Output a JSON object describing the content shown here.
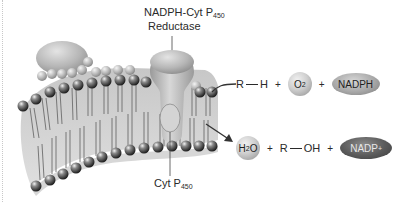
{
  "figure": {
    "type": "membrane-enzyme-diagram",
    "palette": {
      "background": "#ffffff",
      "text": "#2a2a2a",
      "protein": "#b4b4b4",
      "lipid_head": "#3a3a3a",
      "lipid_tail": "#6e6e6e",
      "membrane_shadow": "#9a9a9a",
      "reactant_sphere": "#c8c8c8",
      "nadph": "#a8a8a8",
      "nadp_plus": "#5a5a5a"
    }
  },
  "labels": {
    "reductase_line1_main": "NADPH-Cyt P",
    "reductase_line1_sub": "450",
    "reductase_line2": "Reductase",
    "cyt_main": "Cyt P",
    "cyt_sub": "450"
  },
  "reactants": {
    "substrate": {
      "r": "R",
      "h": "H"
    },
    "plus1": "+",
    "oxygen": {
      "main": "O",
      "sub": "2"
    },
    "plus2": "+",
    "cofactor": "NADPH"
  },
  "products": {
    "water": {
      "h": "H",
      "sub": "2",
      "o": "O"
    },
    "plus1": "+",
    "alcohol": {
      "r": "R",
      "oh": "OH"
    },
    "plus2": "+",
    "cofactor": {
      "main": "NADP",
      "sup": "+"
    }
  }
}
